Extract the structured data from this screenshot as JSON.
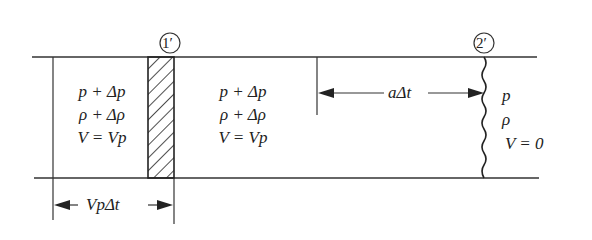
{
  "diagram": {
    "type": "pipe pressure-wave schematic",
    "sections": [
      {
        "id": "1prime",
        "marker": "1′"
      },
      {
        "id": "2prime",
        "marker": "2′"
      }
    ],
    "regions": {
      "left": {
        "lines": [
          "p + Δp",
          "ρ + Δρ",
          "V = Vp"
        ]
      },
      "middle": {
        "lines": [
          "p + Δp",
          "ρ + Δρ",
          "V = Vp"
        ]
      },
      "right": {
        "lines": [
          "p",
          "ρ",
          "V = 0"
        ]
      }
    },
    "dimensions": {
      "bottom": "VpΔt",
      "top": "aΔt"
    }
  }
}
